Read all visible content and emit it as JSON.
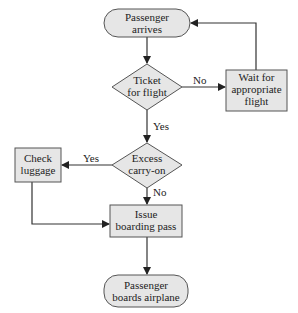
{
  "diagram": {
    "nodes": {
      "start": {
        "type": "terminal",
        "lines": [
          "Passenger",
          "arrives"
        ]
      },
      "ticket": {
        "type": "decision",
        "lines": [
          "Ticket",
          "for flight"
        ]
      },
      "wait": {
        "type": "process",
        "lines": [
          "Wait for",
          "appropriate",
          "flight"
        ]
      },
      "excess": {
        "type": "decision",
        "lines": [
          "Excess",
          "carry-on"
        ]
      },
      "check": {
        "type": "process",
        "lines": [
          "Check",
          "luggage"
        ]
      },
      "issue": {
        "type": "process",
        "lines": [
          "Issue",
          "boarding pass"
        ]
      },
      "end": {
        "type": "terminal",
        "lines": [
          "Passenger",
          "boards airplane"
        ]
      }
    },
    "edges": {
      "start_to_ticket": {
        "label": ""
      },
      "ticket_no": {
        "label": "No"
      },
      "ticket_yes": {
        "label": "Yes"
      },
      "wait_to_start": {
        "label": ""
      },
      "excess_yes": {
        "label": "Yes"
      },
      "excess_no": {
        "label": "No"
      },
      "check_to_issue": {
        "label": ""
      },
      "issue_to_end": {
        "label": ""
      }
    }
  }
}
